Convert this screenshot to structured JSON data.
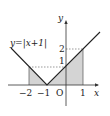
{
  "diagram": {
    "type": "function-graph",
    "function_label": "y=|x+1|",
    "axes": {
      "x_label": "x",
      "y_label": "y",
      "origin_label": "O"
    },
    "x_ticks": [
      "−2",
      "−1",
      "1"
    ],
    "y_ticks": [
      "1",
      "2"
    ],
    "shaded_region": "area under y=|x+1| from x=−2 to x=1",
    "colors": {
      "line": "#222222",
      "shade": "#d4d4d4",
      "dashed": "#555555"
    }
  }
}
